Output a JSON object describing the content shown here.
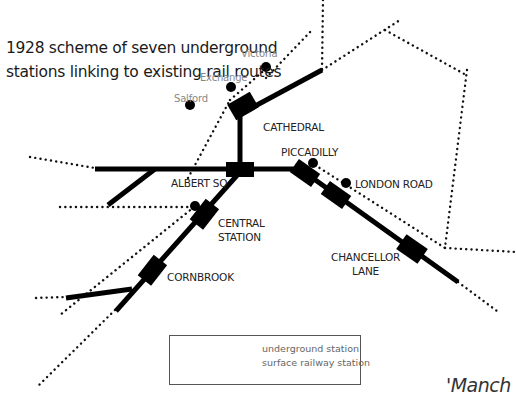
{
  "title": {
    "line1": "1928 scheme of seven underground",
    "line2": "stations linking to existing rail routes"
  },
  "underground_stations": [
    {
      "name": "CATHEDRAL"
    },
    {
      "name": "ALBERT SQ"
    },
    {
      "name": "PICCADILLY"
    },
    {
      "name": "LONDON ROAD"
    },
    {
      "name": "CENTRAL",
      "name2": "STATION"
    },
    {
      "name": "CHANCELLOR",
      "name2": "LANE"
    },
    {
      "name": "CORNBROOK"
    }
  ],
  "surface_stations": [
    {
      "name": "Victoria"
    },
    {
      "name": "Exchange"
    },
    {
      "name": "Salford"
    }
  ],
  "legend": {
    "underground": "underground station",
    "surface": "surface railway station"
  },
  "caption": "'Manch",
  "colors": {
    "line": "#000000",
    "surface_label": "#888888",
    "background": "#ffffff"
  }
}
